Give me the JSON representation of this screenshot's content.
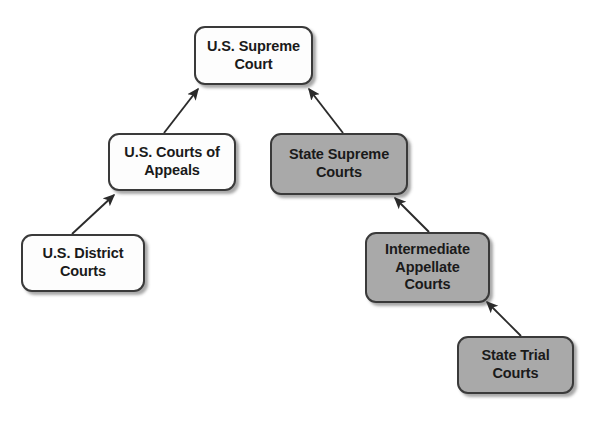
{
  "diagram": {
    "background_color": "#ffffff",
    "federal_fill": "#fdfdfd",
    "state_fill": "#a9a9a9",
    "border_color": "#3a3a3a",
    "text_color": "#1a1a1a",
    "nodes": [
      {
        "id": "us-supreme-court",
        "label": "U.S. Supreme\nCourt",
        "branch": "federal",
        "x": 194,
        "y": 26,
        "w": 119,
        "h": 59
      },
      {
        "id": "us-courts-of-appeals",
        "label": "U.S. Courts of\nAppeals",
        "branch": "federal",
        "x": 108,
        "y": 133,
        "w": 128,
        "h": 58
      },
      {
        "id": "state-supreme-courts",
        "label": "State Supreme\nCourts",
        "branch": "state",
        "x": 270,
        "y": 133,
        "w": 138,
        "h": 62
      },
      {
        "id": "us-district-courts",
        "label": "U.S. District\nCourts",
        "branch": "federal",
        "x": 21,
        "y": 234,
        "w": 124,
        "h": 58
      },
      {
        "id": "intermediate-appellate-courts",
        "label": "Intermediate\nAppellate\nCourts",
        "branch": "state",
        "x": 365,
        "y": 232,
        "w": 125,
        "h": 71
      },
      {
        "id": "state-trial-courts",
        "label": "State Trial\nCourts",
        "branch": "state",
        "x": 457,
        "y": 336,
        "w": 117,
        "h": 58
      }
    ],
    "edges": [
      {
        "id": "appeals-to-supreme",
        "from": "us-courts-of-appeals",
        "to": "us-supreme-court",
        "x1": 164,
        "y1": 133,
        "x2": 198,
        "y2": 88
      },
      {
        "id": "district-to-appeals",
        "from": "us-district-courts",
        "to": "us-courts-of-appeals",
        "x1": 72,
        "y1": 234,
        "x2": 114,
        "y2": 194
      },
      {
        "id": "state-supreme-to-us-supreme",
        "from": "state-supreme-courts",
        "to": "us-supreme-court",
        "x1": 343,
        "y1": 133,
        "x2": 308,
        "y2": 88
      },
      {
        "id": "intermediate-to-state-supreme",
        "from": "intermediate-appellate-courts",
        "to": "state-supreme-courts",
        "x1": 429,
        "y1": 232,
        "x2": 394,
        "y2": 197
      },
      {
        "id": "trial-to-intermediate",
        "from": "state-trial-courts",
        "to": "intermediate-appellate-courts",
        "x1": 521,
        "y1": 336,
        "x2": 486,
        "y2": 301
      }
    ]
  }
}
